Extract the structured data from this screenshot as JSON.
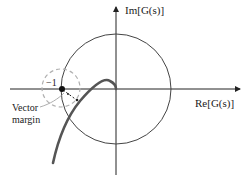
{
  "diagram": {
    "type": "nyquist-plot",
    "axes": {
      "imag_label": "Im[G(s)]",
      "real_label": "Re[G(s)]"
    },
    "critical_point_label": "−1",
    "annotation": {
      "line1": "Vector",
      "line2": "margin"
    },
    "elements": {
      "unit_circle": "solid circle centered at origin",
      "critical_circle": "dashed gray circle centered at -1",
      "nyquist_curve": "thick gray curve approaching origin",
      "vector_margin_arrow": "dashed arrow from -1 to nearest point on curve"
    },
    "colors": {
      "axes": "#222222",
      "unit_circle": "#444444",
      "curve": "#555555",
      "dashed_circle": "#b0b0b0"
    }
  }
}
